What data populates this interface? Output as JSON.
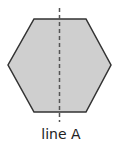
{
  "figure": {
    "shape": "regular-hexagon",
    "fill_color": "#cfcfcf",
    "stroke_color": "#333333",
    "line_of_symmetry": {
      "label": "line A",
      "style": "dashed",
      "orientation": "vertical",
      "color": "#555555"
    }
  }
}
